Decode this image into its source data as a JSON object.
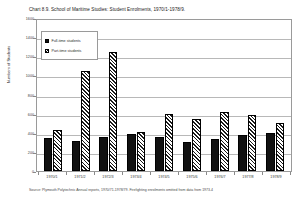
{
  "title": "Chart 8.9.  School of Maritime Studies: Student Enrolments, 1970/1-1978/9.",
  "source": "Source: Plymouth Polytechnic Annual reports, 1970/71-1978/79. Firefighting enrolments omitted from data from 1973-4",
  "legend": {
    "full_time": "Full-time students",
    "part_time": "Part-time students"
  },
  "chart_data": {
    "type": "bar",
    "title": "Chart 8.9.  School of Maritime Studies: Student Enrolments, 1970/1-1978/9.",
    "xlabel": "",
    "ylabel": "Numbers of Students",
    "ylim": [
      0,
      1600
    ],
    "yticks": [
      0,
      200,
      400,
      600,
      800,
      1000,
      1200,
      1400,
      1600
    ],
    "ytick_labels": [
      "0",
      "200",
      "400",
      "600",
      "800",
      "1000",
      "1200",
      "1400",
      "1600"
    ],
    "grid": true,
    "legend_position": "upper-left",
    "categories": [
      "1970/1",
      "1971/2",
      "1972/3",
      "1973/4",
      "1974/5",
      "1975/6",
      "1976/7",
      "1977/8",
      "1978/9"
    ],
    "series": [
      {
        "name": "Full-time students",
        "values": [
          345,
          310,
          360,
          390,
          355,
          305,
          335,
          375,
          400
        ]
      },
      {
        "name": "Part-time students",
        "values": [
          430,
          1050,
          1245,
          405,
          595,
          545,
          620,
          585,
          505
        ]
      }
    ]
  }
}
